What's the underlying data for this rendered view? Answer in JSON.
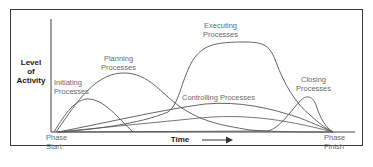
{
  "diagram": {
    "y_axis_label": [
      "Level",
      "of",
      "Activity"
    ],
    "x_axis_label": "Time",
    "start_label": [
      "Phase",
      "Start"
    ],
    "finish_label": [
      "Phase",
      "Finish"
    ],
    "curves": [
      {
        "name": "initiating",
        "label": [
          "Initiating",
          "Processes"
        ]
      },
      {
        "name": "planning",
        "label": [
          "Planning",
          "Processes"
        ]
      },
      {
        "name": "executing",
        "label": [
          "Executing",
          "Processes"
        ]
      },
      {
        "name": "controlling",
        "label": [
          "Controlling Processes"
        ]
      },
      {
        "name": "closing",
        "label": [
          "Closing",
          "Processes"
        ]
      }
    ],
    "colors": {
      "frame": "#3a3a3a",
      "curve": "#555555",
      "axis": "#444444",
      "label": "#6a6a6a"
    }
  },
  "caption": "........"
}
